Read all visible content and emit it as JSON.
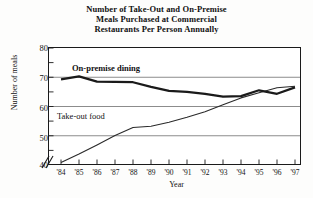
{
  "chart_data": {
    "type": "line",
    "title": "Number of Take-Out and On-Premise Meals Purchased at Commercial Restaurants Per Person Annually",
    "title_lines": [
      "Number of Take-Out and On-Premise",
      "Meals Purchased at Commercial",
      "Restaurants Per Person Annually"
    ],
    "xlabel": "Year",
    "ylabel": "Number of meals",
    "categories": [
      "'84",
      "'85",
      "'86",
      "'87",
      "'88",
      "'89",
      "'90",
      "'91",
      "'92",
      "'93",
      "'94",
      "'95",
      "'96",
      "'97"
    ],
    "x": [
      1984,
      1985,
      1986,
      1987,
      1988,
      1989,
      1990,
      1991,
      1992,
      1993,
      1994,
      1995,
      1996,
      1997
    ],
    "ylim": [
      40,
      80
    ],
    "yticks": [
      40,
      50,
      60,
      70,
      80
    ],
    "ytick_labels": [
      "40",
      "50",
      "60",
      "70",
      "80"
    ],
    "grid": true,
    "grid_axis": "y",
    "axis_break": "//",
    "legend": "inline-annotations",
    "series": [
      {
        "name": "On-premise dining",
        "label": "On-premise dining",
        "style": "thick",
        "color": "#1a1a1a",
        "values": [
          69.2,
          70.2,
          68.4,
          68.3,
          68.2,
          66.6,
          65.2,
          64.9,
          64.2,
          63.2,
          63.4,
          65.4,
          64.2,
          66.4
        ]
      },
      {
        "name": "Take-out food",
        "label": "Take-out food",
        "style": "thin",
        "color": "#2a2a2a",
        "values": [
          40.5,
          43.4,
          46.6,
          49.8,
          52.6,
          53.0,
          54.4,
          56.1,
          58.0,
          60.4,
          62.8,
          64.6,
          66.3,
          66.8
        ]
      }
    ]
  },
  "annotations": {
    "onpremise_label": "On-premise dining",
    "takeout_label": "Take-out food"
  }
}
